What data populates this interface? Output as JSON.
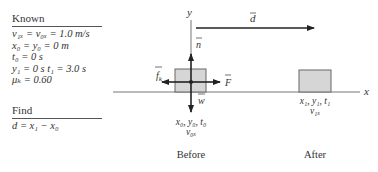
{
  "known": {
    "heading": "Known",
    "lines": [
      "v₁ₓ = v₀ₓ = 1.0 m/s",
      "x₀ = y₀ = 0 m",
      "t₀ = 0 s",
      "y₁ = 0 s    t₁ = 3.0 s",
      "μₖ = 0.60"
    ]
  },
  "find": {
    "heading": "Find",
    "lines": [
      "d = x₁ − x₀"
    ]
  },
  "diagram": {
    "axis_x_label": "x",
    "axis_y_label": "y",
    "displacement_label": "d",
    "forces": {
      "normal": "n",
      "weight": "w",
      "applied": "F",
      "friction": "f",
      "friction_sub": "k"
    },
    "before": {
      "label": "Before",
      "state_line1": "x₀, y₀, t₀",
      "state_line2": "v₀ₓ"
    },
    "after": {
      "label": "After",
      "state_line1": "x₁, y₁, t₁",
      "state_line2": "v₁ₓ"
    },
    "colors": {
      "block_fill": "#d6d6d6",
      "block_stroke": "#666666",
      "arrow": "#222222",
      "axis": "#777777"
    }
  }
}
